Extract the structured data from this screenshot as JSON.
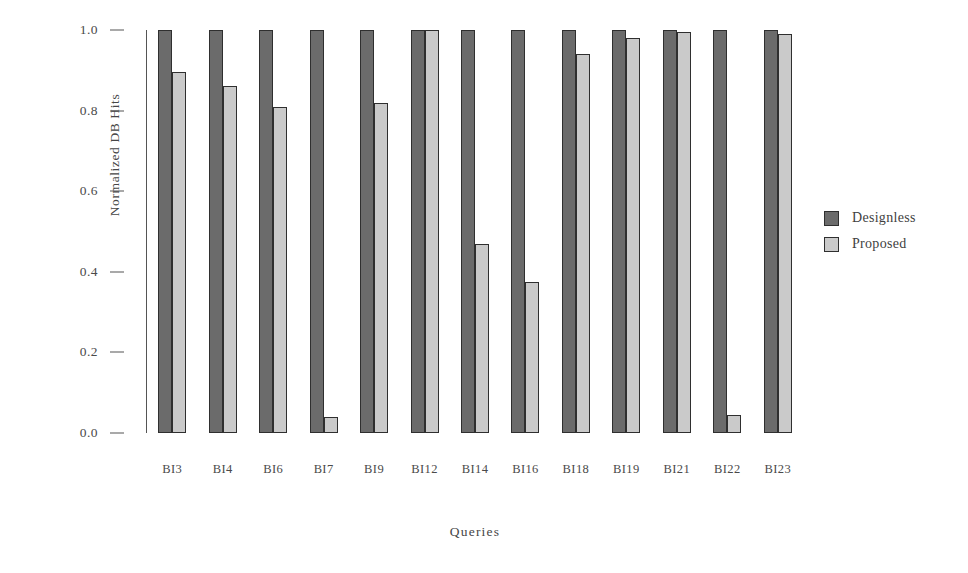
{
  "chart_data": {
    "type": "bar",
    "title": "",
    "xlabel": "Queries",
    "ylabel": "Normalized DB Hits",
    "categories": [
      "BI3",
      "BI4",
      "BI6",
      "BI7",
      "BI9",
      "BI12",
      "BI14",
      "BI16",
      "BI18",
      "BI19",
      "BI21",
      "BI22",
      "BI23"
    ],
    "series": [
      {
        "name": "Designless",
        "color": "#6b6b6b",
        "values": [
          1.0,
          1.0,
          1.0,
          1.0,
          1.0,
          1.0,
          1.0,
          1.0,
          1.0,
          1.0,
          1.0,
          1.0,
          1.0
        ]
      },
      {
        "name": "Proposed",
        "color": "#cacaca",
        "values": [
          0.895,
          0.862,
          0.81,
          0.04,
          0.82,
          1.0,
          0.47,
          0.375,
          0.94,
          0.98,
          0.995,
          0.045,
          0.99
        ]
      }
    ],
    "ylim": [
      0.0,
      1.0
    ],
    "yticks": [
      0.0,
      0.2,
      0.4,
      0.6,
      0.8,
      1.0
    ],
    "ytick_labels": [
      "0.0",
      "0.2",
      "0.4",
      "0.6",
      "0.8",
      "1.0"
    ],
    "grid": false,
    "legend_position": "right"
  },
  "legend": {
    "entries": [
      {
        "label": "Designless",
        "color": "#6b6b6b"
      },
      {
        "label": "Proposed",
        "color": "#cacaca"
      }
    ]
  }
}
